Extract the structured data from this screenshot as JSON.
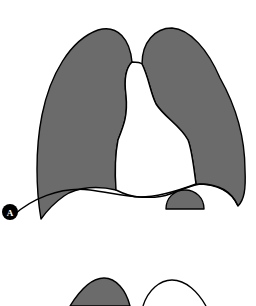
{
  "figure": {
    "panels": [
      {
        "label": "A",
        "description": "Frontal outline of lungs with central mediastinal shadow",
        "structures": [
          "right-lung",
          "left-lung",
          "mediastinum",
          "diaphragm",
          "stomach-bubble"
        ]
      },
      {
        "label": "",
        "description": "Partially visible second panel showing top of lung outlines",
        "structures": [
          "right-lung-apex",
          "left-lung-apex-outline"
        ]
      }
    ],
    "colors": {
      "lung_fill": "#6b6b6b",
      "outline": "#000000",
      "background": "#ffffff"
    }
  }
}
